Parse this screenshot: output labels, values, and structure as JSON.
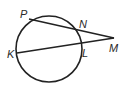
{
  "diagram": {
    "type": "circle-two-secants",
    "points": {
      "P": "P",
      "N": "N",
      "M": "M",
      "K": "K",
      "L": "L"
    },
    "segments": [
      {
        "from": "P",
        "to": "M",
        "passes_through": "N"
      },
      {
        "from": "K",
        "to": "M",
        "passes_through": "L"
      }
    ],
    "stroke_color": "#222222"
  }
}
